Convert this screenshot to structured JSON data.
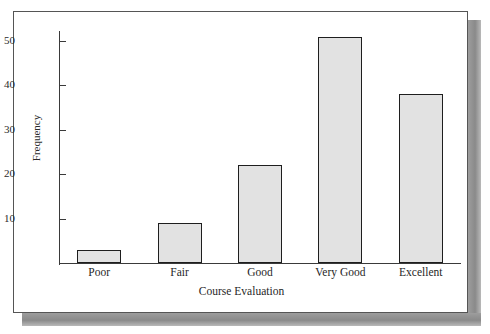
{
  "chart_data": {
    "type": "bar",
    "title": "",
    "subtitle": "",
    "xlabel": "Course Evaluation",
    "ylabel": "Frequency",
    "categories": [
      "Poor",
      "Fair",
      "Good",
      "Very Good",
      "Excellent"
    ],
    "values": [
      3,
      9,
      22,
      51,
      38
    ],
    "series": [
      {
        "name": "Frequency",
        "values": [
          3,
          9,
          22,
          51,
          38
        ]
      }
    ],
    "ylim": [
      0,
      53
    ],
    "yticks": [
      10,
      20,
      30,
      40,
      50
    ],
    "ytick_labels": [
      "10",
      "20",
      "30",
      "40",
      "50"
    ],
    "xticks": [
      "Poor",
      "Fair",
      "Good",
      "Very Good",
      "Excellent"
    ],
    "grid": false,
    "legend": false,
    "legend_position": "none",
    "annotations": [],
    "colors": {
      "bar_fill": "#e2e2e2",
      "bar_edge": "#1e1e1e",
      "axis": "#3a3a3a",
      "text": "#1f1f1f",
      "plate_background": "#ffffff",
      "frame_border": "#555555",
      "drop_shadow": "#8e8e8e"
    }
  },
  "figure": {
    "frame": {
      "border_label": "figure-frame",
      "shadow_label": "figure-drop-shadow"
    }
  },
  "axes": {
    "y": {
      "label": "Frequency",
      "ticks": [
        {
          "value": 50,
          "label": "50"
        },
        {
          "value": 40,
          "label": "40"
        },
        {
          "value": 30,
          "label": "30"
        },
        {
          "value": 20,
          "label": "20"
        },
        {
          "value": 10,
          "label": "10"
        }
      ]
    },
    "x": {
      "label": "Course Evaluation",
      "ticks": [
        {
          "label": "Poor"
        },
        {
          "label": "Fair"
        },
        {
          "label": "Good"
        },
        {
          "label": "Very Good"
        },
        {
          "label": "Excellent"
        }
      ]
    }
  },
  "bars": [
    {
      "category": "Poor",
      "value": 3
    },
    {
      "category": "Fair",
      "value": 9
    },
    {
      "category": "Good",
      "value": 22
    },
    {
      "category": "Very Good",
      "value": 51
    },
    {
      "category": "Excellent",
      "value": 38
    }
  ]
}
